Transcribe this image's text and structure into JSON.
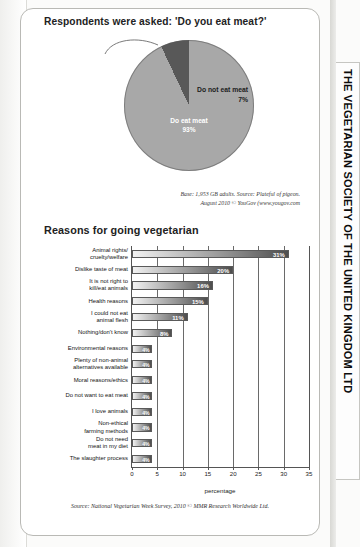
{
  "side_tab": {
    "text": "THE VEGETARIAN SOCIETY OF THE UNITED KINGDOM LTD"
  },
  "pie_section": {
    "heading": "Respondents were asked: 'Do you eat meat?'",
    "source_line1": "Base: 1,953 GB adults. Source: Plateful of pigeon.",
    "source_line2": "August 2010 © YouGov (www.yougov.com"
  },
  "bar_section": {
    "heading": "Reasons for going vegetarian",
    "source": "Source: National Vegetarian Week Survey, 2010 © MMR Research Worldwide Ltd."
  },
  "chart_data": [
    {
      "type": "pie",
      "title": "Respondents were asked: 'Do you eat meat?'",
      "categories": [
        "Do eat meat",
        "Do not eat meat"
      ],
      "values": [
        93,
        7
      ],
      "value_labels": [
        "93%",
        "7%"
      ],
      "colors": [
        "#a8a8a8",
        "#585858"
      ],
      "legend": "none",
      "annotations": [
        "Base: 1,953 GB adults. Source: Plateful of pigeon.",
        "August 2010 © YouGov (www.yougov.com"
      ]
    },
    {
      "type": "bar",
      "orientation": "horizontal",
      "title": "Reasons for going vegetarian",
      "xlabel": "percentage",
      "ylabel": "",
      "xlim": [
        0,
        35
      ],
      "xticks": [
        0,
        5,
        10,
        15,
        20,
        25,
        30,
        35
      ],
      "grid": true,
      "categories": [
        "Animal rights/\ncruelty/welfare",
        "Dislike taste of meat",
        "It is not right to\nkill/eat animals",
        "Health reasons",
        "I could not eat\nanimal flesh",
        "Nothing/don't know",
        "Environmental reasons",
        "Plenty of non-animal\nalternatives available",
        "Moral reasons/ethics",
        "Do not want to eat meat",
        "I love animals",
        "Non-ethical\nfarming methods",
        "Do not need\nmeat in my diet",
        "The slaughter process"
      ],
      "values": [
        31,
        20,
        16,
        15,
        11,
        8,
        4,
        4,
        4,
        4,
        4,
        4,
        4,
        4
      ],
      "value_labels": [
        "31%",
        "20%",
        "16%",
        "15%",
        "11%",
        "8%",
        "4%",
        "4%",
        "4%",
        "4%",
        "4%",
        "4%",
        "4%",
        "4%"
      ],
      "annotations": [
        "Source: National Vegetarian Week Survey, 2010 © MMR Research Worldwide Ltd."
      ]
    }
  ]
}
